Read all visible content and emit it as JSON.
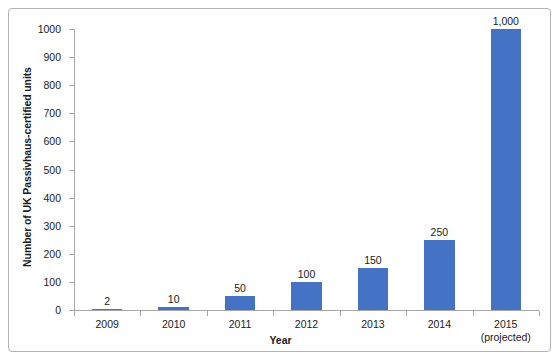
{
  "chart_data": {
    "type": "bar",
    "title": "",
    "xlabel": "Year",
    "ylabel": "Number of UK Passivhaus-certified units",
    "categories": [
      "2009",
      "2010",
      "2011",
      "2012",
      "2013",
      "2014",
      "2015"
    ],
    "category_sublabels": [
      "",
      "",
      "",
      "",
      "",
      "",
      "(projected)"
    ],
    "values": [
      2,
      10,
      50,
      100,
      150,
      250,
      1000
    ],
    "value_labels": [
      "2",
      "10",
      "50",
      "100",
      "150",
      "250",
      "1,000"
    ],
    "ylim": [
      0,
      1000
    ],
    "ytick_labels": [
      "0",
      "100",
      "200",
      "300",
      "400",
      "500",
      "600",
      "700",
      "800",
      "900",
      "1000"
    ],
    "ytick_values": [
      0,
      100,
      200,
      300,
      400,
      500,
      600,
      700,
      800,
      900,
      1000
    ],
    "grid": false,
    "legend": false,
    "bar_color": "#4472c4",
    "axis_color": "#a6a6a6",
    "text_color": "#1a1a1a",
    "border_color": "#b3b3b3",
    "background_color": "#ffffff"
  }
}
